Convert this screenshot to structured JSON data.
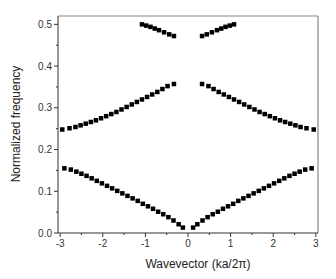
{
  "chart_data": {
    "type": "scatter",
    "title": "",
    "xlabel": "Wavevector (ka/2π)",
    "ylabel": "Normalized frequency",
    "xlim": [
      -3.05,
      3.05
    ],
    "ylim": [
      0.0,
      0.52
    ],
    "xticks": [
      -3,
      -2,
      -1,
      0,
      1,
      2,
      3
    ],
    "xtick_labels": [
      "-3",
      "-2",
      "-1",
      "0",
      "1",
      "2",
      "3"
    ],
    "yticks": [
      0.0,
      0.1,
      0.2,
      0.3,
      0.4,
      0.5
    ],
    "ytick_labels": [
      "0.0",
      "0.1",
      "0.2",
      "0.3",
      "0.4",
      "0.5"
    ],
    "grid": false,
    "legend": null,
    "marker": "square",
    "marker_color": "#000000",
    "series": [
      {
        "name": "band-1-left",
        "x": [
          -2.9,
          -2.75,
          -2.62,
          -2.5,
          -2.38,
          -2.26,
          -2.14,
          -2.02,
          -1.9,
          -1.78,
          -1.66,
          -1.54,
          -1.42,
          -1.3,
          -1.18,
          -1.06,
          -0.94,
          -0.82,
          -0.7,
          -0.58,
          -0.46,
          -0.34,
          -0.22,
          -0.12
        ],
        "y": [
          0.155,
          0.152,
          0.147,
          0.142,
          0.137,
          0.131,
          0.125,
          0.119,
          0.113,
          0.107,
          0.101,
          0.095,
          0.089,
          0.083,
          0.077,
          0.07,
          0.064,
          0.058,
          0.051,
          0.045,
          0.038,
          0.03,
          0.021,
          0.013
        ]
      },
      {
        "name": "band-1-right",
        "x": [
          0.12,
          0.22,
          0.34,
          0.46,
          0.58,
          0.7,
          0.82,
          0.94,
          1.06,
          1.18,
          1.3,
          1.42,
          1.54,
          1.66,
          1.78,
          1.9,
          2.02,
          2.14,
          2.26,
          2.38,
          2.5,
          2.62,
          2.75,
          2.9
        ],
        "y": [
          0.013,
          0.021,
          0.03,
          0.038,
          0.045,
          0.051,
          0.058,
          0.064,
          0.07,
          0.077,
          0.083,
          0.089,
          0.095,
          0.101,
          0.107,
          0.113,
          0.119,
          0.125,
          0.131,
          0.137,
          0.142,
          0.147,
          0.152,
          0.155
        ]
      },
      {
        "name": "band-2-left",
        "x": [
          -2.95,
          -2.78,
          -2.64,
          -2.52,
          -2.4,
          -2.28,
          -2.16,
          -2.04,
          -1.92,
          -1.8,
          -1.68,
          -1.56,
          -1.44,
          -1.32,
          -1.2,
          -1.08,
          -0.96,
          -0.84,
          -0.72,
          -0.6,
          -0.48,
          -0.33
        ],
        "y": [
          0.248,
          0.251,
          0.254,
          0.258,
          0.262,
          0.266,
          0.27,
          0.275,
          0.28,
          0.285,
          0.29,
          0.296,
          0.302,
          0.308,
          0.314,
          0.32,
          0.326,
          0.332,
          0.338,
          0.345,
          0.352,
          0.357
        ]
      },
      {
        "name": "band-2-right",
        "x": [
          0.33,
          0.48,
          0.6,
          0.72,
          0.84,
          0.96,
          1.08,
          1.2,
          1.32,
          1.44,
          1.56,
          1.68,
          1.8,
          1.92,
          2.04,
          2.16,
          2.28,
          2.4,
          2.52,
          2.64,
          2.78,
          2.95
        ],
        "y": [
          0.357,
          0.352,
          0.345,
          0.338,
          0.332,
          0.326,
          0.32,
          0.314,
          0.308,
          0.302,
          0.296,
          0.29,
          0.285,
          0.28,
          0.275,
          0.27,
          0.266,
          0.262,
          0.258,
          0.254,
          0.251,
          0.248
        ]
      },
      {
        "name": "band-3-left",
        "x": [
          -1.08,
          -0.98,
          -0.88,
          -0.78,
          -0.68,
          -0.56,
          -0.44,
          -0.33
        ],
        "y": [
          0.5,
          0.497,
          0.494,
          0.49,
          0.486,
          0.481,
          0.476,
          0.472
        ]
      },
      {
        "name": "band-3-right",
        "x": [
          0.33,
          0.44,
          0.56,
          0.68,
          0.78,
          0.88,
          0.98,
          1.08
        ],
        "y": [
          0.472,
          0.476,
          0.481,
          0.486,
          0.49,
          0.494,
          0.497,
          0.5
        ]
      }
    ]
  },
  "layout": {
    "plot_left": 58,
    "plot_right": 318,
    "plot_top": 16,
    "plot_bottom": 233,
    "frame_color": "#888888",
    "axis_color": "#333333"
  }
}
